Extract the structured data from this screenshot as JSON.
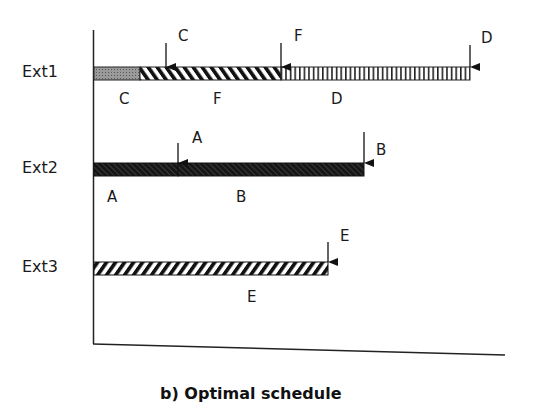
{
  "diagram": {
    "caption": "b) Optimal schedule",
    "rows": [
      {
        "label": "Ext1",
        "segments": [
          {
            "name": "C",
            "pattern": "dotted-gray"
          },
          {
            "name": "F",
            "pattern": "diagonal-back"
          },
          {
            "name": "D",
            "pattern": "vertical"
          }
        ],
        "arrows": [
          "C",
          "F",
          "D"
        ]
      },
      {
        "label": "Ext2",
        "segments": [
          {
            "name": "A",
            "pattern": "dark-hatch"
          },
          {
            "name": "B",
            "pattern": "dark-hatch"
          }
        ],
        "arrows": [
          "A",
          "B"
        ]
      },
      {
        "label": "Ext3",
        "segments": [
          {
            "name": "E",
            "pattern": "diagonal-forward"
          }
        ],
        "arrows": [
          "E"
        ]
      }
    ]
  }
}
